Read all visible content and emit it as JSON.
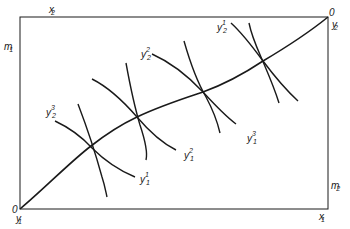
{
  "diagram": {
    "type": "edgeworth-box",
    "colors": {
      "line": "#1a1a1a",
      "background": "#ffffff"
    },
    "box": {
      "left": 20,
      "top": 17,
      "right": 328,
      "bottom": 209
    },
    "origins": {
      "bottom_left": {
        "zero": "0",
        "label": "y",
        "sub": "1"
      },
      "top_right": {
        "zero": "0",
        "label": "y",
        "sub": "2"
      }
    },
    "axis_labels": {
      "top": {
        "label": "x",
        "sub": "2"
      },
      "left": {
        "label": "m",
        "sub": "1"
      },
      "right": {
        "label": "m",
        "sub": "2"
      },
      "bottom": {
        "label": "x",
        "sub": "1"
      }
    },
    "curve_labels": [
      {
        "id": "y2-3",
        "label": "y",
        "sup": "3",
        "sub": "2"
      },
      {
        "id": "y2-2",
        "label": "y",
        "sup": "2",
        "sub": "2"
      },
      {
        "id": "y2-1",
        "label": "y",
        "sup": "1",
        "sub": "2"
      },
      {
        "id": "y1-1",
        "label": "y",
        "sup": "1",
        "sub": "1"
      },
      {
        "id": "y1-2",
        "label": "y",
        "sup": "2",
        "sub": "1"
      },
      {
        "id": "y1-3",
        "label": "y",
        "sup": "3",
        "sub": "1"
      }
    ],
    "tangency_points": [
      [
        91,
        146
      ],
      [
        137,
        117
      ],
      [
        203,
        92
      ],
      [
        263,
        61
      ]
    ]
  }
}
